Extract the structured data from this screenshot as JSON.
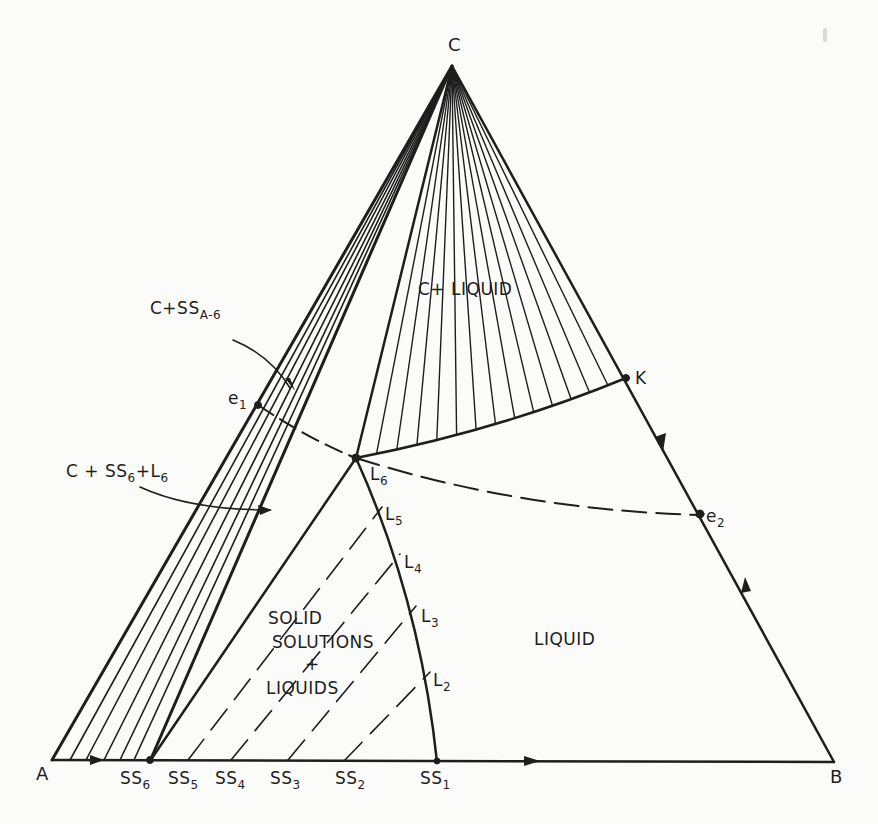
{
  "diagram": {
    "type": "ternary phase diagram",
    "vertices": {
      "A": "A",
      "B": "B",
      "C": "C"
    },
    "points": {
      "e1": "e",
      "e1_sub": "1",
      "e2": "e",
      "e2_sub": "2",
      "K": "K",
      "L6": "L",
      "L6_sub": "6",
      "L5": "L",
      "L5_sub": "5",
      "L4": "L",
      "L4_sub": "4",
      "L3": "L",
      "L3_sub": "3",
      "L2": "L",
      "L2_sub": "2"
    },
    "baseline_labels": [
      {
        "main": "SS",
        "sub": "6"
      },
      {
        "main": "SS",
        "sub": "5"
      },
      {
        "main": "SS",
        "sub": "4"
      },
      {
        "main": "SS",
        "sub": "3"
      },
      {
        "main": "SS",
        "sub": "2"
      },
      {
        "main": "SS",
        "sub": "1"
      }
    ],
    "regions": {
      "c_liquid": "C+ LIQUID",
      "c_ss_a6_main": "C+SS",
      "c_ss_a6_sub": "A-6",
      "c_ss6_l6_a": "C + SS",
      "c_ss6_l6_sub1": "6",
      "c_ss6_l6_b": "+L",
      "c_ss6_l6_sub2": "6",
      "solid_line1": "SOLID",
      "solid_line2": "SOLUTIONS",
      "solid_line3": "+",
      "solid_line4": "LIQUIDS",
      "liquid": "LIQUID"
    },
    "ink_color": "#1e1e1e",
    "paper_color": "#fbfbfa"
  }
}
